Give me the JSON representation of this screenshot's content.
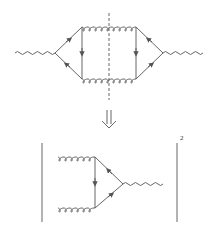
{
  "diagram": {
    "type": "feynman",
    "top": {
      "external": [
        "photon-in",
        "photon-out"
      ],
      "internal": [
        "quark-loop-left",
        "quark-loop-right",
        "gluon-top",
        "gluon-bottom"
      ],
      "cut": "dashed-vertical"
    },
    "arrow": "implies-double-arrow",
    "bottom": {
      "external": [
        "gluon-top",
        "gluon-bottom",
        "photon-out"
      ],
      "internal": [
        "quark-triangle"
      ],
      "exponent": "2"
    },
    "colors": {
      "line": "#555555",
      "background": "#ffffff"
    }
  }
}
